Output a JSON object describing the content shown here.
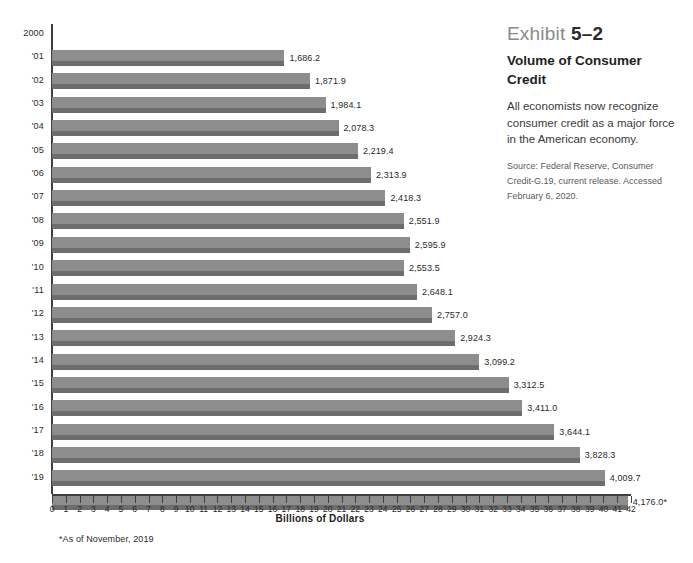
{
  "info": {
    "exhibit_prefix": "Exhibit",
    "exhibit_number": "5–2",
    "title": "Volume of Consumer Credit",
    "description": "All economists now recognize consumer credit as a major force in the American economy.",
    "source": "Source: Federal Reserve, Consumer Credit-G.19, current release. Accessed February 6, 2020."
  },
  "footnote": "*As of November, 2019",
  "chart_data": {
    "type": "bar",
    "orientation": "horizontal",
    "title": "Volume of Consumer Credit",
    "xlabel": "Billions of Dollars",
    "ylabel": "",
    "xlim": [
      0,
      42
    ],
    "x_tick_unit_value": 100,
    "grid": false,
    "legend": null,
    "categories": [
      "2000",
      "'01",
      "'02",
      "'03",
      "'04",
      "'05",
      "'06",
      "'07",
      "'08",
      "'09",
      "'10",
      "'11",
      "'12",
      "'13",
      "'14",
      "'15",
      "'16",
      "'17",
      "'18",
      "'19"
    ],
    "values": [
      1686.2,
      1871.9,
      1984.1,
      2078.3,
      2219.4,
      2313.9,
      2418.3,
      2551.9,
      2595.9,
      2553.5,
      2648.1,
      2757.0,
      2924.3,
      3099.2,
      3312.5,
      3411.0,
      3644.1,
      3828.3,
      4009.7,
      4176.0
    ],
    "value_labels": [
      "1,686.2",
      "1,871.9",
      "1,984.1",
      "2,078.3",
      "2,219.4",
      "2,313.9",
      "2,418.3",
      "2,551.9",
      "2,595.9",
      "2,553.5",
      "2,648.1",
      "2,757.0",
      "2,924.3",
      "3,099.2",
      "3,312.5",
      "3,411.0",
      "3,644.1",
      "3,828.3",
      "4,009.7",
      "4,176.0*"
    ],
    "xticks": [
      "0",
      "1",
      "2",
      "3",
      "4",
      "5",
      "6",
      "7",
      "8",
      "9",
      "10",
      "11",
      "12",
      "13",
      "14",
      "15",
      "16",
      "17",
      "18",
      "19",
      "20",
      "21",
      "22",
      "23",
      "24",
      "25",
      "26",
      "27",
      "28",
      "29",
      "30",
      "31",
      "32",
      "33",
      "34",
      "35",
      "36",
      "37",
      "38",
      "39",
      "40",
      "41",
      "42"
    ],
    "colors": {
      "bar_fill": "#8d8d8d",
      "bar_shadow": "#6d6d6d",
      "axis": "#3f3f3f",
      "text": "#231f20",
      "exhibit_gray": "#8a8a8a"
    }
  }
}
